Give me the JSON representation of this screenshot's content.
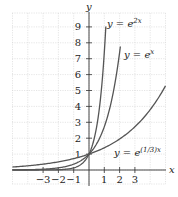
{
  "chart_data": {
    "type": "line",
    "title": "",
    "xlabel": "x",
    "ylabel": "y",
    "xlim": [
      -5,
      5
    ],
    "ylim": [
      -0.8,
      9.8
    ],
    "grid": true,
    "x_ticks": [
      -3,
      -2,
      -1,
      1,
      2,
      3
    ],
    "y_ticks": [
      1,
      2,
      3,
      4,
      5,
      6,
      7,
      8,
      9
    ],
    "x_tick_labels": [
      "−3",
      "−2",
      "−1",
      "1",
      "2",
      "3"
    ],
    "y_tick_labels": [
      "1",
      "2",
      "3",
      "4",
      "5",
      "6",
      "7",
      "8",
      "9"
    ],
    "series": [
      {
        "name": "y = e^{2x}",
        "label_base": "y = e",
        "label_exp": "2x",
        "k": 2,
        "x_end": 1.1,
        "points": [
          [
            -5,
            5e-05
          ],
          [
            -2,
            0.018
          ],
          [
            -1,
            0.135
          ],
          [
            0,
            1
          ],
          [
            0.5,
            2.72
          ],
          [
            1,
            7.39
          ],
          [
            1.1,
            9.03
          ]
        ]
      },
      {
        "name": "y = e^{x}",
        "label_base": "y = e",
        "label_exp": "x",
        "k": 1,
        "x_end": 2.05,
        "points": [
          [
            -5,
            0.0067
          ],
          [
            -2,
            0.135
          ],
          [
            -1,
            0.368
          ],
          [
            0,
            1
          ],
          [
            1,
            2.72
          ],
          [
            2,
            7.39
          ],
          [
            2.05,
            7.77
          ]
        ]
      },
      {
        "name": "y = e^{(1/3)x}",
        "label_base": "y = e",
        "label_exp": "(1/3)x",
        "k": 0.3333,
        "x_end": 5,
        "points": [
          [
            -5,
            0.189
          ],
          [
            -3,
            0.368
          ],
          [
            -1,
            0.717
          ],
          [
            0,
            1
          ],
          [
            1,
            1.4
          ],
          [
            2,
            1.95
          ],
          [
            3,
            2.72
          ],
          [
            4,
            3.79
          ],
          [
            5,
            5.29
          ]
        ]
      }
    ],
    "annotations": [
      "y = e^{2x}",
      "y = e^{x}",
      "y = e^{(1/3)x}"
    ],
    "legend": "none (inline labels)"
  }
}
